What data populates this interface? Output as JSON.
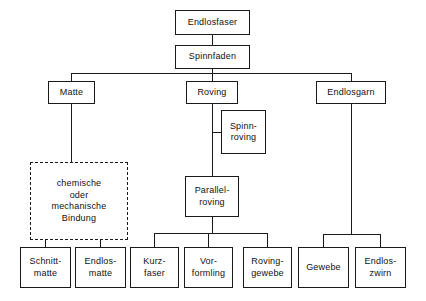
{
  "diagram": {
    "title": "Endlosfaser",
    "type": "tree-hierarchy",
    "language": "de",
    "colors": {
      "background": "#ffffff",
      "stroke": "#1a1a1a",
      "text": "#111111"
    },
    "nodes": [
      {
        "id": "endlosfaser",
        "label": "Endlosfaser",
        "level": 0,
        "style": "solid"
      },
      {
        "id": "spinnfaden",
        "label": "Spinnfaden",
        "level": 1,
        "style": "solid"
      },
      {
        "id": "matte",
        "label": "Matte",
        "level": 2,
        "style": "solid"
      },
      {
        "id": "roving",
        "label": "Roving",
        "level": 2,
        "style": "solid"
      },
      {
        "id": "endlosgarn",
        "label": "Endlosgarn",
        "level": 2,
        "style": "solid"
      },
      {
        "id": "spinnroving",
        "label": "Spinn-\nroving",
        "level": 3,
        "style": "solid"
      },
      {
        "id": "bindung",
        "label": "chemische\noder\nmechanische\nBindung",
        "level": 3,
        "style": "dashed"
      },
      {
        "id": "parallelroving",
        "label": "Parallel-\nroving",
        "level": 3,
        "style": "solid"
      },
      {
        "id": "schnittmatte",
        "label": "Schnitt-\nmatte",
        "level": 4,
        "style": "solid"
      },
      {
        "id": "endlosmatte",
        "label": "Endlos-\nmatte",
        "level": 4,
        "style": "solid"
      },
      {
        "id": "kurzfaser",
        "label": "Kurz-\nfaser",
        "level": 4,
        "style": "solid"
      },
      {
        "id": "vorformling",
        "label": "Vor-\nformling",
        "level": 4,
        "style": "solid"
      },
      {
        "id": "rovinggewebe",
        "label": "Roving-\ngewebe",
        "level": 4,
        "style": "solid"
      },
      {
        "id": "gewebe",
        "label": "Gewebe",
        "level": 4,
        "style": "solid"
      },
      {
        "id": "endloszwirn",
        "label": "Endlos-\nzwirn",
        "level": 4,
        "style": "solid"
      }
    ],
    "edges": [
      {
        "from": "endlosfaser",
        "to": "spinnfaden"
      },
      {
        "from": "spinnfaden",
        "to": "matte"
      },
      {
        "from": "spinnfaden",
        "to": "roving"
      },
      {
        "from": "spinnfaden",
        "to": "endlosgarn"
      },
      {
        "from": "matte",
        "to": "bindung"
      },
      {
        "from": "roving",
        "to": "spinnroving"
      },
      {
        "from": "roving",
        "to": "parallelroving"
      },
      {
        "from": "bindung",
        "to": "schnittmatte"
      },
      {
        "from": "bindung",
        "to": "endlosmatte"
      },
      {
        "from": "parallelroving",
        "to": "kurzfaser"
      },
      {
        "from": "parallelroving",
        "to": "vorformling"
      },
      {
        "from": "parallelroving",
        "to": "rovinggewebe"
      },
      {
        "from": "endlosgarn",
        "to": "gewebe"
      },
      {
        "from": "endlosgarn",
        "to": "endloszwirn"
      }
    ]
  }
}
